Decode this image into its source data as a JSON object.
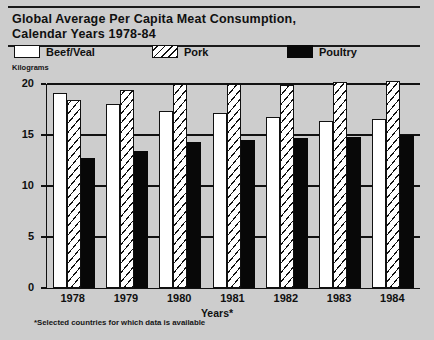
{
  "header": {
    "title": "Global Average Per Capita Meat Consumption,\nCalendar Years 1978-84"
  },
  "legend": {
    "items": [
      {
        "label": "Beef/Veal",
        "swatch": "white-box-swatch"
      },
      {
        "label": "Pork",
        "swatch": "diagonal-hatch-swatch"
      },
      {
        "label": "Poultry",
        "swatch": "solid-black-swatch"
      }
    ]
  },
  "footnote": "*Selected countries for which data is available",
  "chart_data": {
    "type": "bar",
    "title": "Global Average Per Capita Meat Consumption, Calendar Years 1978-84",
    "xlabel": "Years*",
    "ylabel": "Kilograms",
    "ylim": [
      0,
      20
    ],
    "yticks": [
      "0",
      "5",
      "10",
      "15",
      "20"
    ],
    "ytick_values": [
      0,
      5,
      10,
      15,
      20
    ],
    "grid": true,
    "legend_position": "top",
    "categories": [
      "1978",
      "1979",
      "1980",
      "1981",
      "1982",
      "1983",
      "1984"
    ],
    "series": [
      {
        "name": "Beef/Veal",
        "values": [
          19.1,
          18.0,
          17.4,
          17.2,
          16.8,
          16.4,
          16.6
        ]
      },
      {
        "name": "Pork",
        "values": [
          18.4,
          19.4,
          20.0,
          20.0,
          19.9,
          20.2,
          20.3
        ]
      },
      {
        "name": "Poultry",
        "values": [
          12.7,
          13.4,
          14.3,
          14.5,
          14.7,
          14.8,
          15.0
        ]
      }
    ]
  }
}
